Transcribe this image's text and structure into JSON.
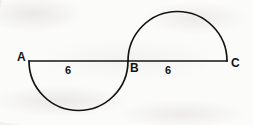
{
  "figure": {
    "background_color": "#fbfbfa",
    "stroke_color": "#141414",
    "stroke_width": 1.6,
    "vertices": [
      {
        "id": "A",
        "label": "A",
        "x": 29,
        "y": 61
      },
      {
        "id": "B",
        "label": "B",
        "x": 128,
        "y": 61
      },
      {
        "id": "C",
        "label": "C",
        "x": 227,
        "y": 61
      }
    ],
    "segments": [
      {
        "id": "AC",
        "from": "A",
        "to": "C",
        "kind": "straight-line"
      }
    ],
    "arcs": [
      {
        "id": "arc-AB",
        "kind": "semicircle",
        "diameter_endpoints": [
          "A",
          "B"
        ],
        "bulge": "downward",
        "center_x": 78.5,
        "center_y": 61,
        "radius": 49.5
      },
      {
        "id": "arc-BC",
        "kind": "semicircle",
        "diameter_endpoints": [
          "B",
          "C"
        ],
        "bulge": "upward",
        "center_x": 177.5,
        "center_y": 61,
        "radius": 49.5
      }
    ],
    "length_labels": [
      {
        "id": "len-AB",
        "segment": "AB",
        "value": "6"
      },
      {
        "id": "len-BC",
        "segment": "BC",
        "value": "6"
      }
    ]
  }
}
